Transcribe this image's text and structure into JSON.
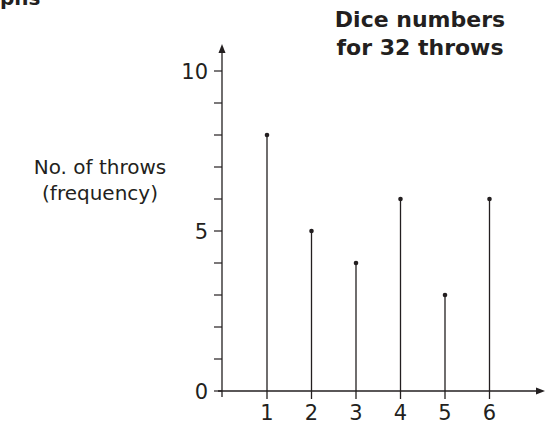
{
  "header": {
    "corner_text": "phs"
  },
  "chart_data": {
    "type": "bar",
    "subtype": "vertical-line (stick) chart",
    "title": "Dice numbers for 32 throws",
    "title_lines": [
      "Dice numbers",
      "for 32 throws"
    ],
    "xlabel": "",
    "ylabel": "No. of throws (frequency)",
    "ylabel_lines": [
      "No. of throws",
      "(frequency)"
    ],
    "categories": [
      "1",
      "2",
      "3",
      "4",
      "5",
      "6"
    ],
    "values": [
      8,
      5,
      4,
      6,
      3,
      6
    ],
    "ylim": [
      0,
      10
    ],
    "y_tick_labels": [
      "0",
      "5",
      "10"
    ],
    "y_minor_ticks_every": 1,
    "grid": false,
    "legend": null
  }
}
